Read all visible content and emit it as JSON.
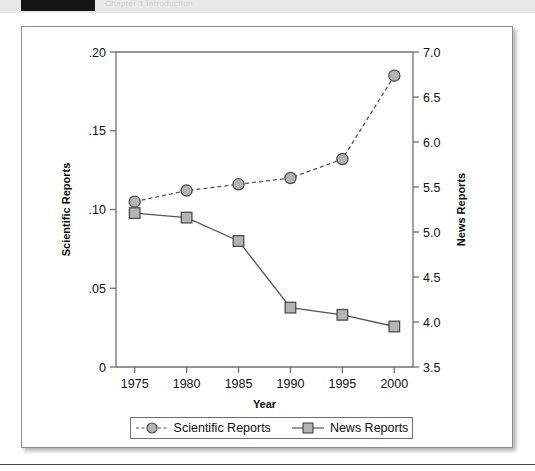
{
  "page": {
    "header_faint_text": "Chapter 1   Introduction",
    "black_block": "header-block"
  },
  "chart_data": {
    "type": "line",
    "title": "",
    "xlabel": "Year",
    "ylabel": "Scientific Reports",
    "y2label": "News Reports",
    "x": [
      1975,
      1980,
      1985,
      1990,
      1995,
      2000
    ],
    "xticklabels": [
      "1975",
      "1980",
      "1985",
      "1990",
      "1995",
      "2000"
    ],
    "xlim": [
      1973.2,
      2001.8
    ],
    "ylim": [
      0,
      0.2
    ],
    "yticks": [
      0,
      0.05,
      0.1,
      0.15,
      0.2
    ],
    "yticklabels": [
      "0",
      ".05",
      ".10",
      ".15",
      ".20"
    ],
    "y2lim": [
      3.5,
      7.0
    ],
    "y2ticks": [
      3.5,
      4.0,
      4.5,
      5.0,
      5.5,
      6.0,
      6.5,
      7.0
    ],
    "y2ticklabels": [
      "3.5",
      "4.0",
      "4.5",
      "5.0",
      "5.5",
      "6.0",
      "6.5",
      "7.0"
    ],
    "grid": false,
    "legend_position": "below-axes",
    "series": [
      {
        "name": "Scientific Reports",
        "axis": "left",
        "marker": "circle",
        "linestyle": "dashed",
        "color": "#b4b4b4",
        "edge_color": "#4d4d4d",
        "values": [
          0.105,
          0.112,
          0.116,
          0.12,
          0.132,
          0.185
        ]
      },
      {
        "name": "News Reports",
        "axis": "right",
        "marker": "square",
        "linestyle": "solid",
        "color": "#b4b4b4",
        "edge_color": "#4d4d4d",
        "values": [
          5.21,
          5.16,
          4.9,
          4.16,
          4.08,
          3.95
        ]
      }
    ],
    "legend": [
      "Scientific Reports",
      "News Reports"
    ]
  }
}
